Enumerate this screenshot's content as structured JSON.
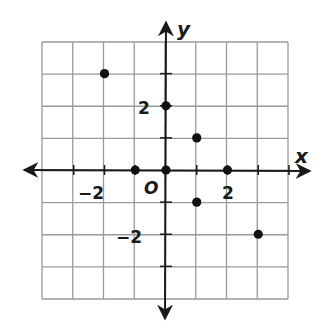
{
  "diagram": {
    "type": "coordinate-plane",
    "axes": {
      "x_label": "x",
      "y_label": "y",
      "origin_label": "O",
      "x_range": [
        -4,
        4
      ],
      "y_range": [
        -4,
        4
      ]
    },
    "tick_labels": {
      "x_neg2": "−2",
      "x_pos2": "2",
      "y_pos2": "2",
      "y_neg2": "−2"
    },
    "colors": {
      "grid": "#9a9a9a",
      "axis": "#1a1a1a",
      "point": "#111111"
    }
  },
  "chart_data": {
    "type": "scatter",
    "title": "",
    "xlabel": "x",
    "ylabel": "y",
    "xlim": [
      -4,
      4
    ],
    "ylim": [
      -4,
      4
    ],
    "grid": true,
    "points": [
      {
        "x": -2,
        "y": 3
      },
      {
        "x": 0,
        "y": 2
      },
      {
        "x": 1,
        "y": 1
      },
      {
        "x": -1,
        "y": 0
      },
      {
        "x": 0,
        "y": 0
      },
      {
        "x": 2,
        "y": 0
      },
      {
        "x": 1,
        "y": -1
      },
      {
        "x": 3,
        "y": -2
      }
    ],
    "tick_labels": {
      "x": [
        "−2",
        "2"
      ],
      "y": [
        "2",
        "−2"
      ]
    }
  }
}
